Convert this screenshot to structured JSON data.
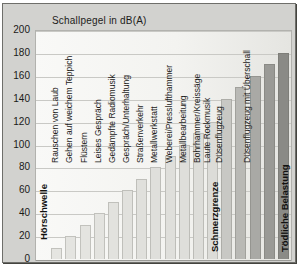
{
  "chart_data": {
    "type": "bar",
    "title": "Schallpegel in dB(A)",
    "xlabel": "",
    "ylabel": "",
    "ylim": [
      0,
      200
    ],
    "yticks": [
      0,
      20,
      40,
      60,
      80,
      100,
      120,
      140,
      160,
      180,
      200
    ],
    "grid": true,
    "legend_position": "none",
    "bar_color_light": "#e6e6e2",
    "bar_color_mid": "#dcdcd8",
    "bar_color_dark_start": "#c8c8c4",
    "bar_color_dark_end": "#8a8a86",
    "bars": [
      {
        "label": "Hörschwelle",
        "value": 0,
        "label_style": "bold"
      },
      {
        "label": "Rauschen von Laub",
        "value": 10,
        "label_style": "normal"
      },
      {
        "label": "Gehen auf weichem Teppich",
        "value": 20,
        "label_style": "normal"
      },
      {
        "label": "Flüstern",
        "value": 30,
        "label_style": "normal"
      },
      {
        "label": "Leises Gespräch",
        "value": 40,
        "label_style": "normal"
      },
      {
        "label": "Gedämpfte Radiomusik",
        "value": 50,
        "label_style": "normal"
      },
      {
        "label": "Gespräch/Unterhaltung",
        "value": 60,
        "label_style": "normal"
      },
      {
        "label": "Straßenverkehr",
        "value": 70,
        "label_style": "normal"
      },
      {
        "label": "Metallwerkstatt",
        "value": 80,
        "label_style": "normal"
      },
      {
        "label": "Weberei/Presslufthammer",
        "value": 90,
        "label_style": "normal"
      },
      {
        "label": "Metallbearbeitung",
        "value": 100,
        "label_style": "normal"
      },
      {
        "label": "Bohrhammer/Kreissäge",
        "value": 110,
        "label_style": "normal"
      },
      {
        "label": "Laute Rockmusik",
        "value": 120,
        "label_style": "normal"
      },
      {
        "label": "Düsenflugzeug",
        "value": 140,
        "label_style": "normal"
      },
      {
        "label": "",
        "value": 150,
        "label_style": "none"
      },
      {
        "label": "Düsenflugzeug mit Überschall",
        "value": 160,
        "label_style": "normal"
      },
      {
        "label": "",
        "value": 170,
        "label_style": "none"
      },
      {
        "label": "Tödliche Belastung",
        "value": 180,
        "label_style": "bold"
      }
    ],
    "thresholds": [
      {
        "label": "Schmerzgrenze",
        "value": 130
      }
    ]
  }
}
